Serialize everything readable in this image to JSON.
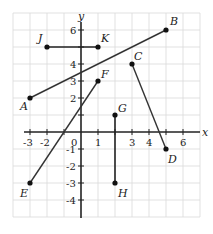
{
  "axes": {
    "x_label": "x",
    "y_label": "y",
    "origin_label": "0",
    "x_ticks": [
      "-3",
      "-2",
      "1",
      "3",
      "4",
      "6"
    ],
    "y_ticks": [
      "6",
      "4",
      "3",
      "2",
      "-1",
      "-2",
      "-3",
      "-4"
    ]
  },
  "points": {
    "A": {
      "label": "A",
      "x": -3,
      "y": 2
    },
    "B": {
      "label": "B",
      "x": 5,
      "y": 6
    },
    "C": {
      "label": "C",
      "x": 3,
      "y": 4
    },
    "D": {
      "label": "D",
      "x": 5,
      "y": -1
    },
    "E": {
      "label": "E",
      "x": -3,
      "y": -3
    },
    "F": {
      "label": "F",
      "x": 1,
      "y": 3
    },
    "G": {
      "label": "G",
      "x": 2,
      "y": 1
    },
    "H": {
      "label": "H",
      "x": 2,
      "y": -3
    },
    "J": {
      "label": "J",
      "x": -2,
      "y": 5
    },
    "K": {
      "label": "K",
      "x": 1,
      "y": 5
    }
  },
  "segments": [
    {
      "name": "AB",
      "from": "A",
      "to": "B"
    },
    {
      "name": "CD",
      "from": "C",
      "to": "D"
    },
    {
      "name": "EF",
      "from": "E",
      "to": "F"
    },
    {
      "name": "GH",
      "from": "G",
      "to": "H"
    },
    {
      "name": "JK",
      "from": "J",
      "to": "K"
    }
  ]
}
